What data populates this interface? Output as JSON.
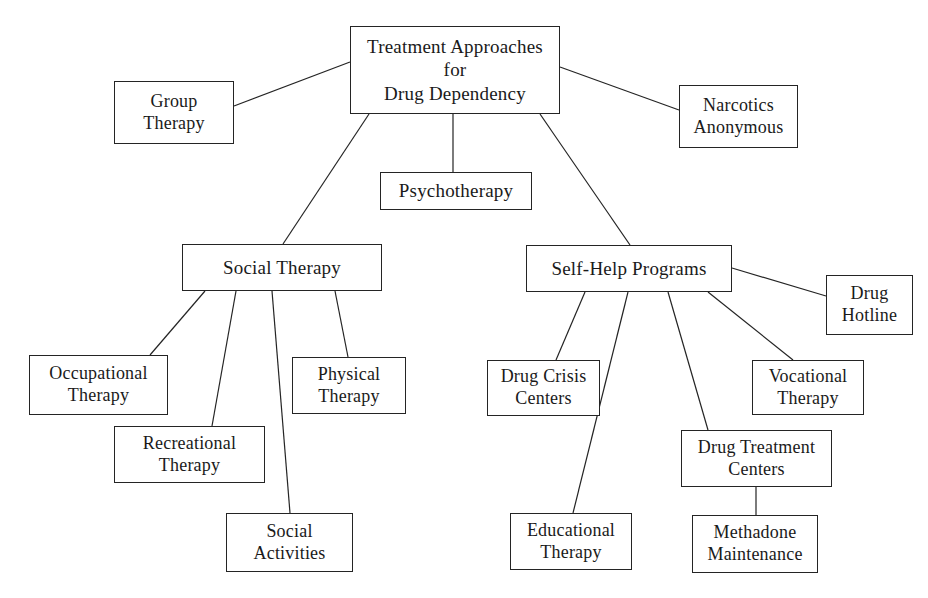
{
  "diagram": {
    "title": "Treatment Approaches for Drug Dependency",
    "type": "hierarchical-tree",
    "background_color": "#ffffff",
    "line_color": "#242424",
    "text_color": "#1a1a1a",
    "nodes": [
      {
        "id": "root",
        "label": "Treatment Approaches\nfor\nDrug Dependency",
        "x": 350,
        "y": 26,
        "w": 210,
        "h": 88,
        "font_size": 19
      },
      {
        "id": "group-therapy",
        "label": "Group\nTherapy",
        "x": 114,
        "y": 81,
        "w": 120,
        "h": 63,
        "font_size": 18
      },
      {
        "id": "narcotics-anonymous",
        "label": "Narcotics\nAnonymous",
        "x": 679,
        "y": 85,
        "w": 119,
        "h": 63,
        "font_size": 18
      },
      {
        "id": "psychotherapy",
        "label": "Psychotherapy",
        "x": 380,
        "y": 172,
        "w": 152,
        "h": 38,
        "font_size": 19
      },
      {
        "id": "social-therapy",
        "label": "Social Therapy",
        "x": 182,
        "y": 244,
        "w": 200,
        "h": 47,
        "font_size": 19
      },
      {
        "id": "self-help-programs",
        "label": "Self-Help Programs",
        "x": 526,
        "y": 245,
        "w": 206,
        "h": 47,
        "font_size": 19
      },
      {
        "id": "drug-hotline",
        "label": "Drug\nHotline",
        "x": 826,
        "y": 275,
        "w": 87,
        "h": 60,
        "font_size": 18
      },
      {
        "id": "occupational-therapy",
        "label": "Occupational\nTherapy",
        "x": 29,
        "y": 355,
        "w": 139,
        "h": 60,
        "font_size": 18
      },
      {
        "id": "physical-therapy",
        "label": "Physical\nTherapy",
        "x": 292,
        "y": 357,
        "w": 114,
        "h": 57,
        "font_size": 18
      },
      {
        "id": "drug-crisis-centers",
        "label": "Drug Crisis\nCenters",
        "x": 487,
        "y": 360,
        "w": 113,
        "h": 56,
        "font_size": 18
      },
      {
        "id": "vocational-therapy",
        "label": "Vocational\nTherapy",
        "x": 752,
        "y": 360,
        "w": 112,
        "h": 55,
        "font_size": 18
      },
      {
        "id": "recreational-therapy",
        "label": "Recreational\nTherapy",
        "x": 114,
        "y": 426,
        "w": 151,
        "h": 57,
        "font_size": 18
      },
      {
        "id": "drug-treatment-centers",
        "label": "Drug Treatment\nCenters",
        "x": 681,
        "y": 430,
        "w": 151,
        "h": 57,
        "font_size": 18
      },
      {
        "id": "social-activities",
        "label": "Social\nActivities",
        "x": 226,
        "y": 513,
        "w": 127,
        "h": 59,
        "font_size": 18
      },
      {
        "id": "educational-therapy",
        "label": "Educational\nTherapy",
        "x": 510,
        "y": 513,
        "w": 122,
        "h": 57,
        "font_size": 18
      },
      {
        "id": "methadone-maintenance",
        "label": "Methadone\nMaintenance",
        "x": 692,
        "y": 515,
        "w": 126,
        "h": 58,
        "font_size": 18
      }
    ],
    "edges": [
      {
        "id": "root-to-group-therapy",
        "from": "root",
        "to": "group-therapy",
        "x1": 350,
        "y1": 62,
        "x2": 234,
        "y2": 106
      },
      {
        "id": "root-to-narcotics-anonymous",
        "from": "root",
        "to": "narcotics-anonymous",
        "x1": 560,
        "y1": 67,
        "x2": 679,
        "y2": 110
      },
      {
        "id": "root-to-psychotherapy",
        "from": "root",
        "to": "psychotherapy",
        "x1": 453,
        "y1": 114,
        "x2": 453,
        "y2": 172
      },
      {
        "id": "root-to-social-therapy",
        "from": "root",
        "to": "social-therapy",
        "x1": 369,
        "y1": 114,
        "x2": 283,
        "y2": 244
      },
      {
        "id": "root-to-self-help-programs",
        "from": "root",
        "to": "self-help-programs",
        "x1": 540,
        "y1": 114,
        "x2": 630,
        "y2": 245
      },
      {
        "id": "social-therapy-to-occupational-therapy",
        "from": "social-therapy",
        "to": "occupational-therapy",
        "x1": 205,
        "y1": 291,
        "x2": 150,
        "y2": 355
      },
      {
        "id": "social-therapy-to-recreational-therapy",
        "from": "social-therapy",
        "to": "recreational-therapy",
        "x1": 236,
        "y1": 291,
        "x2": 212,
        "y2": 426
      },
      {
        "id": "social-therapy-to-social-activities",
        "from": "social-therapy",
        "to": "social-activities",
        "x1": 272,
        "y1": 291,
        "x2": 290,
        "y2": 513
      },
      {
        "id": "social-therapy-to-physical-therapy",
        "from": "social-therapy",
        "to": "physical-therapy",
        "x1": 335,
        "y1": 291,
        "x2": 348,
        "y2": 357
      },
      {
        "id": "self-help-to-drug-crisis-centers",
        "from": "self-help-programs",
        "to": "drug-crisis-centers",
        "x1": 585,
        "y1": 292,
        "x2": 556,
        "y2": 360
      },
      {
        "id": "self-help-to-educational-therapy",
        "from": "self-help-programs",
        "to": "educational-therapy",
        "x1": 628,
        "y1": 292,
        "x2": 573,
        "y2": 513
      },
      {
        "id": "self-help-to-drug-treatment-centers",
        "from": "self-help-programs",
        "to": "drug-treatment-centers",
        "x1": 668,
        "y1": 292,
        "x2": 708,
        "y2": 430
      },
      {
        "id": "self-help-to-vocational-therapy",
        "from": "self-help-programs",
        "to": "vocational-therapy",
        "x1": 708,
        "y1": 292,
        "x2": 793,
        "y2": 360
      },
      {
        "id": "self-help-to-drug-hotline",
        "from": "self-help-programs",
        "to": "drug-hotline",
        "x1": 732,
        "y1": 268,
        "x2": 826,
        "y2": 296
      },
      {
        "id": "drug-treatment-to-methadone-maintenance",
        "from": "drug-treatment-centers",
        "to": "methadone-maintenance",
        "x1": 756,
        "y1": 487,
        "x2": 756,
        "y2": 515
      }
    ]
  }
}
